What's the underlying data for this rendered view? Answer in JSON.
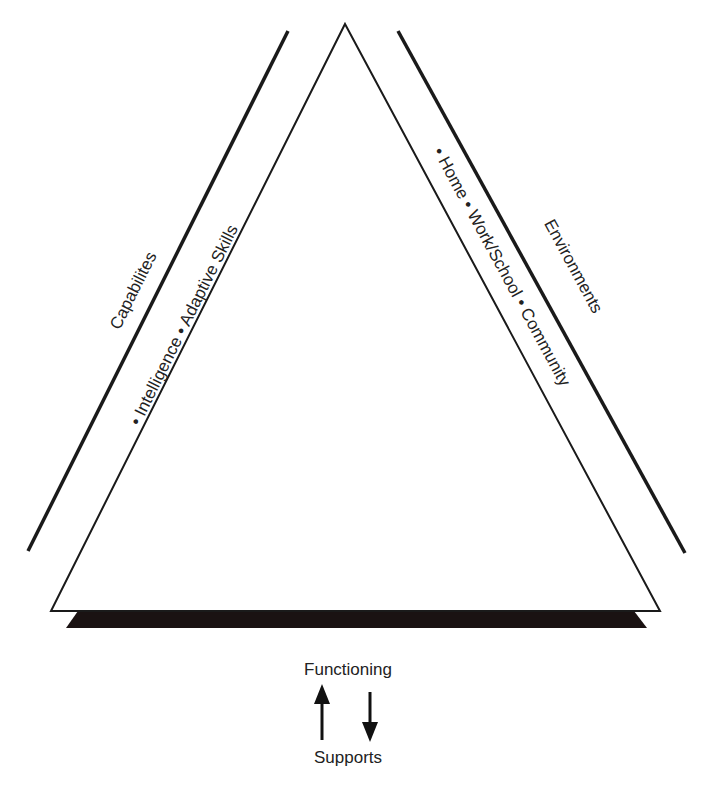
{
  "diagram": {
    "type": "triangle-framework",
    "left_side": {
      "outer_label": "Capabilites",
      "inner_label": "• Intelligence • Adaptive Skills"
    },
    "right_side": {
      "outer_label": "Environments",
      "inner_label": "• Home • Work/School • Community"
    },
    "bottom": {
      "top_label": "Functioning",
      "bottom_label": "Supports",
      "arrows": [
        "up-arrow",
        "down-arrow"
      ]
    },
    "colors": {
      "line": "#1a1a1a",
      "base_bar": "#1a1212",
      "background": "#ffffff"
    }
  }
}
